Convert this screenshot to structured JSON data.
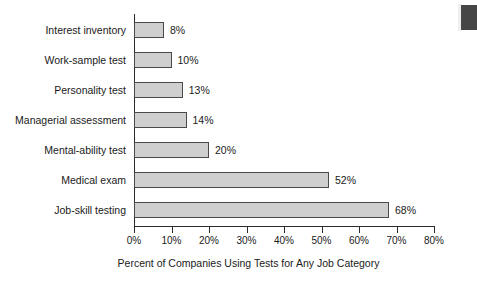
{
  "chart_data": {
    "type": "bar",
    "orientation": "horizontal",
    "title": "",
    "xlabel": "Percent of Companies Using Tests for Any Job Category",
    "ylabel": "",
    "xlim": [
      0,
      80
    ],
    "grid": false,
    "legend": null,
    "categories": [
      "Interest inventory",
      "Work-sample test",
      "Personality test",
      "Managerial assessment",
      "Mental-ability test",
      "Medical exam",
      "Job-skill testing"
    ],
    "values": [
      8,
      10,
      13,
      14,
      20,
      52,
      68
    ],
    "value_labels": [
      "8%",
      "10%",
      "13%",
      "14%",
      "20%",
      "52%",
      "68%"
    ],
    "xticks": [
      0,
      10,
      20,
      30,
      40,
      50,
      60,
      70,
      80
    ],
    "xtick_labels": [
      "0%",
      "10%",
      "20%",
      "30%",
      "40%",
      "50%",
      "60%",
      "70%",
      "80%"
    ],
    "colors": {
      "bar_fill": "#cfcfcf",
      "bar_stroke": "#4a4a4a",
      "axis": "#2b2b2b",
      "text": "#1a1a1a",
      "background": "#ffffff"
    }
  }
}
